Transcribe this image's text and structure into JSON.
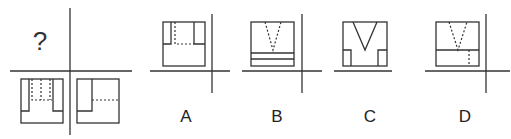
{
  "question": {
    "mark": "?",
    "description": "Three-view projection puzzle: front view and side view shown; top view is missing."
  },
  "options": [
    {
      "id": "A",
      "label": "A"
    },
    {
      "id": "B",
      "label": "B"
    },
    {
      "id": "C",
      "label": "C"
    },
    {
      "id": "D",
      "label": "D"
    }
  ],
  "colors": {
    "line": "#333333",
    "background": "#ffffff"
  }
}
